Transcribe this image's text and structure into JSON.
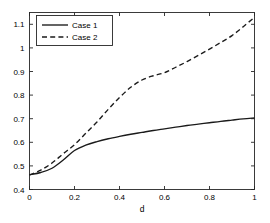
{
  "figure": {
    "background_color": "#ffffff",
    "axis_color": "#262626",
    "line_color": "#1a1a1a"
  },
  "chart_data": {
    "type": "line",
    "title": "",
    "xlabel": "d",
    "ylabel": "",
    "xlim": [
      0,
      1
    ],
    "ylim": [
      0.4,
      1.15
    ],
    "grid": false,
    "legend_position": "top-left",
    "xticks": [
      0,
      0.2,
      0.4,
      0.6,
      0.8,
      1
    ],
    "xticklabels": [
      "0",
      "0.2",
      "0.4",
      "0.6",
      "0.8",
      "1"
    ],
    "yticks": [
      0.4,
      0.5,
      0.6,
      0.7,
      0.8,
      0.9,
      1.0,
      1.1
    ],
    "yticklabels": [
      "0.4",
      "0.5",
      "0.6",
      "0.7",
      "0.8",
      "0.9",
      "1",
      "1.1"
    ],
    "x": [
      0,
      0.05,
      0.1,
      0.15,
      0.2,
      0.25,
      0.3,
      0.35,
      0.4,
      0.45,
      0.5,
      0.55,
      0.6,
      0.65,
      0.7,
      0.75,
      0.8,
      0.85,
      0.9,
      0.95,
      1.0
    ],
    "series": [
      {
        "name": "Case 1",
        "style": "solid",
        "values": [
          0.462,
          0.472,
          0.49,
          0.525,
          0.565,
          0.588,
          0.603,
          0.615,
          0.625,
          0.634,
          0.642,
          0.65,
          0.657,
          0.664,
          0.671,
          0.677,
          0.683,
          0.689,
          0.694,
          0.699,
          0.703
        ]
      },
      {
        "name": "Case 2",
        "style": "dashed",
        "values": [
          0.462,
          0.482,
          0.512,
          0.552,
          0.59,
          0.638,
          0.686,
          0.74,
          0.79,
          0.833,
          0.864,
          0.882,
          0.895,
          0.918,
          0.942,
          0.968,
          0.995,
          1.023,
          1.052,
          1.09,
          1.13
        ]
      }
    ]
  },
  "legend": {
    "entries": [
      {
        "label": "Case 1",
        "style": "solid"
      },
      {
        "label": "Case 2",
        "style": "dashed"
      }
    ]
  }
}
